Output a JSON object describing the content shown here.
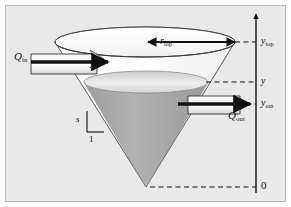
{
  "figure": {
    "kind": "engineering-diagram",
    "background_color": "#e9e9e9",
    "frame_color": "#b9b9b9",
    "liquid_color": "#a9a9a9",
    "cone_wall_color": "#ffffff",
    "line_color": "#111111"
  },
  "axis": {
    "name": "vertical-elevation-axis",
    "orientation": "vertical",
    "arrow_at": "top",
    "ticks": [
      {
        "id": "ytop",
        "label": "y",
        "subscript": "top",
        "y_px": 42
      },
      {
        "id": "y",
        "label": "y",
        "subscript": "",
        "y_px": 82
      },
      {
        "id": "yout",
        "label": "y",
        "subscript": "out",
        "y_px": 104
      },
      {
        "id": "zero",
        "label": "0",
        "subscript": "",
        "y_px": 187
      }
    ]
  },
  "labels": {
    "q_in": {
      "symbol": "Q",
      "subscript": "in"
    },
    "q_out": {
      "symbol": "Q",
      "subscript": "out"
    },
    "r_top": {
      "symbol": "r",
      "subscript": "top"
    },
    "y_top": {
      "symbol": "y",
      "subscript": "top"
    },
    "y_level": {
      "symbol": "y",
      "subscript": ""
    },
    "y_out": {
      "symbol": "y",
      "subscript": "out"
    },
    "zero": {
      "symbol": "0",
      "subscript": ""
    },
    "slope_rise": {
      "symbol": "s",
      "subscript": ""
    },
    "slope_run": {
      "symbol": "1",
      "subscript": ""
    }
  },
  "geometry": {
    "cone_top_center_x": 145,
    "cone_top_center_y": 42,
    "cone_top_rx": 90,
    "cone_top_ry": 15,
    "cone_apex_x": 146,
    "cone_apex_y": 187,
    "liquid_center_x": 146,
    "liquid_center_y": 82,
    "liquid_rx": 62,
    "liquid_ry": 11,
    "axis_x": 256,
    "axis_top_y": 14,
    "axis_bottom_y": 193
  },
  "arrows": {
    "inflow": {
      "name": "q-in-arrow",
      "direction": "right",
      "x1": 30,
      "x2": 110,
      "y": 62
    },
    "outflow": {
      "name": "q-out-arrow",
      "direction": "right",
      "x1": 178,
      "x2": 245,
      "y": 104
    },
    "radius": {
      "name": "r-top-double-arrow",
      "direction": "both",
      "x1": 148,
      "x2": 235,
      "y": 42
    }
  }
}
